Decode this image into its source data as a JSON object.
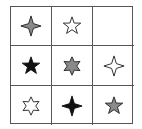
{
  "puzzle": {
    "rows": 3,
    "cols": 3,
    "colors": {
      "black": "#111111",
      "gray": "#8a8a8a",
      "white": "#ffffff",
      "stroke": "#222222",
      "grid": "#555555"
    },
    "cells": [
      {
        "row": 1,
        "col": 1,
        "shape": "4-point-star",
        "fill": "gray"
      },
      {
        "row": 1,
        "col": 2,
        "shape": "5-point-star",
        "fill": "white"
      },
      {
        "row": 1,
        "col": 3,
        "shape": "empty",
        "fill": "none"
      },
      {
        "row": 2,
        "col": 1,
        "shape": "5-point-star",
        "fill": "black"
      },
      {
        "row": 2,
        "col": 2,
        "shape": "6-point-star",
        "fill": "gray"
      },
      {
        "row": 2,
        "col": 3,
        "shape": "4-point-star",
        "fill": "white"
      },
      {
        "row": 3,
        "col": 1,
        "shape": "6-point-star",
        "fill": "white"
      },
      {
        "row": 3,
        "col": 2,
        "shape": "4-point-star",
        "fill": "black"
      },
      {
        "row": 3,
        "col": 3,
        "shape": "5-point-star",
        "fill": "gray"
      }
    ]
  }
}
